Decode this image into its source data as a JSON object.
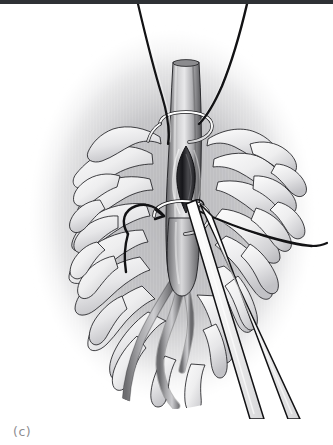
{
  "figure": {
    "caption": "(c)",
    "panel_letter": "c",
    "medium": "grayscale medical line illustration",
    "top_rule_color": "#2e3135",
    "background_color": "#ffffff",
    "caption_color": "#8d8d90"
  },
  "palette": {
    "outline": "#1c1c1c",
    "vessel_mid": "#9a9a9c",
    "vessel_dark": "#5e5e61",
    "vessel_light": "#d8d8da",
    "tissue_light": "#f2f2f3",
    "tissue_mid": "#c9c9cb",
    "tissue_shadow": "#a7a7aa",
    "vignette": "#b9b9bc",
    "instrument_fill": "#fbfbfb",
    "suture_dark": "#161616",
    "incision_dark": "#3a3a3d"
  },
  "anatomy": {
    "main_vessel": {
      "name": "main vessel trunk",
      "orientation": "vertical",
      "top_y": 60,
      "bottom_y": 290
    },
    "incision": {
      "name": "longitudinal venotomy",
      "shape": "almond",
      "center_x": 186,
      "center_y": 175,
      "length": 66,
      "width": 13
    },
    "branches": [
      {
        "name": "left branch vessel",
        "path": "tortuous descending left"
      },
      {
        "name": "middle branch vessel",
        "path": "tortuous descending center"
      },
      {
        "name": "right branch vessel",
        "path": "short descending right"
      }
    ],
    "tissue": {
      "name": "mesenteric fat lobules",
      "description": "finger-like lobular projections radiating outward"
    }
  },
  "instruments": [
    {
      "name": "vessel-loop-upper",
      "type": "encircling vessel loop",
      "x": 186,
      "y": 128
    },
    {
      "name": "vessel-loop-lower",
      "type": "encircling vessel loop",
      "x": 182,
      "y": 220
    },
    {
      "name": "suture-thread-left",
      "type": "curved suture",
      "enters": "top edge"
    },
    {
      "name": "suture-thread-right",
      "type": "curved suture",
      "enters": "top edge"
    },
    {
      "name": "traction-thread-left",
      "type": "curved tie with pointed tip",
      "side": "left"
    },
    {
      "name": "traction-thread-right",
      "type": "horizontal tie",
      "side": "right"
    },
    {
      "name": "forceps",
      "type": "fine dissecting forceps",
      "angle": "upper-left to lower-right"
    }
  ]
}
